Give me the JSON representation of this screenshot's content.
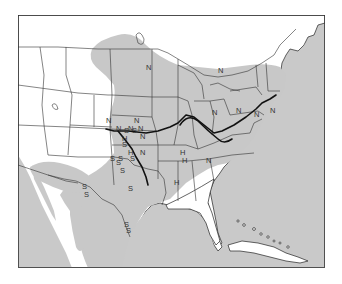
{
  "map": {
    "title": "",
    "region": "United States, southern Canada, northern Mexico and Caribbean",
    "shaded_region_color": "#c8c8c8",
    "water_color": "#c9c9c9",
    "land_color": "#ffffff",
    "route_color": "#111111",
    "legend": {
      "N": "marker N",
      "S": "marker S",
      "H": "marker H"
    },
    "markers": [
      {
        "label": "N",
        "place": "Wisconsin"
      },
      {
        "label": "N",
        "place": "Ontario / Lake Ontario"
      },
      {
        "label": "N",
        "place": "Pennsylvania"
      },
      {
        "label": "N",
        "place": "off Connecticut / Long Island"
      },
      {
        "label": "N",
        "place": "Kentucky / West Virginia"
      },
      {
        "label": "N",
        "place": "Virginia"
      },
      {
        "label": "N",
        "place": "Kansas west"
      },
      {
        "label": "N",
        "place": "Kansas east"
      },
      {
        "label": "N",
        "place": "Oklahoma / Kansas border"
      },
      {
        "label": "S",
        "place": "Oklahoma / Kansas border"
      },
      {
        "label": "N",
        "place": "Oklahoma / Kansas border"
      },
      {
        "label": "S",
        "place": "Oklahoma / Kansas border"
      },
      {
        "label": "N",
        "place": "Kansas / Missouri"
      },
      {
        "label": "N",
        "place": "Missouri border"
      },
      {
        "label": "H",
        "place": "Oklahoma"
      },
      {
        "label": "S",
        "place": "Oklahoma"
      },
      {
        "label": "S",
        "place": "Oklahoma"
      },
      {
        "label": "H",
        "place": "Oklahoma"
      },
      {
        "label": "N",
        "place": "Arkansas"
      },
      {
        "label": "S",
        "place": "Oklahoma / Texas"
      },
      {
        "label": "S",
        "place": "Texas panhandle"
      },
      {
        "label": "S",
        "place": "Texas"
      },
      {
        "label": "S",
        "place": "Texas"
      },
      {
        "label": "S",
        "place": "New Mexico"
      },
      {
        "label": "S",
        "place": "West Texas"
      },
      {
        "label": "S",
        "place": "Central Texas"
      },
      {
        "label": "S",
        "place": "South Texas"
      },
      {
        "label": "S",
        "place": "South Texas"
      },
      {
        "label": "H",
        "place": "Tennessee / Kentucky"
      },
      {
        "label": "H",
        "place": "Tennessee"
      },
      {
        "label": "H",
        "place": "Mississippi"
      },
      {
        "label": "N",
        "place": "Tennessee / North Carolina"
      }
    ]
  }
}
